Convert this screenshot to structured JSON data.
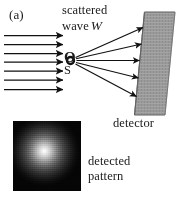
{
  "figure": {
    "panel_label": "(a)",
    "width": 183,
    "height": 210,
    "background_color": "#ffffff",
    "ink_color": "#1b1b1b"
  },
  "annotations": {
    "scattered_line1": "scattered",
    "scattered_line2": "wave",
    "wave_symbol": "W",
    "origin_symbol": "O",
    "source_symbol": "S",
    "detector_label": "detector",
    "detected_line1": "detected",
    "detected_line2": "pattern"
  },
  "incident_beam": {
    "count": 7,
    "description": "incident plane wave arrows",
    "color": "#111111",
    "x_start": 4,
    "x_end": 64,
    "y_values": [
      35.5,
      44.5,
      53.5,
      62.0,
      71.0,
      80.0,
      89.5
    ]
  },
  "scatter_point": {
    "x": 70.5,
    "y": 60.5,
    "radius_outer": 4.4,
    "radius_inner": 2.3,
    "color": "#111111"
  },
  "scattered_rays": {
    "count": 5,
    "color": "#111111",
    "origin": {
      "x": 74.5,
      "y": 60.5
    },
    "endpoints": [
      {
        "x": 144.0,
        "y": 27.0
      },
      {
        "x": 142.0,
        "y": 44.0
      },
      {
        "x": 140.0,
        "y": 60.5
      },
      {
        "x": 139.0,
        "y": 78.0
      },
      {
        "x": 137.0,
        "y": 96.0
      }
    ]
  },
  "detector": {
    "shape": "slanted-panel",
    "fill_color": "#9a9a9a",
    "edge_color": "#6d6d6d",
    "top_left": {
      "x": 144.5,
      "y": 12.0
    },
    "top_right": {
      "x": 175.0,
      "y": 12.0
    },
    "bottom_right": {
      "x": 165.0,
      "y": 115.0
    },
    "bottom_left": {
      "x": 134.5,
      "y": 115.0
    }
  },
  "detected_pattern": {
    "type": "speckle-halo",
    "box": {
      "x": 13,
      "y": 121,
      "width": 68,
      "height": 70
    },
    "background_color": "#060606",
    "core_color": "#ffffff",
    "core_center": {
      "x_pct": 46,
      "y_pct": 43
    }
  }
}
